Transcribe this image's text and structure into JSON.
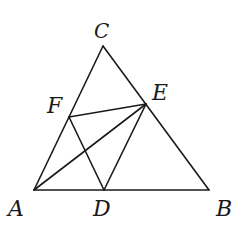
{
  "diagram": {
    "points": {
      "A": {
        "label": "A",
        "x": 34,
        "y": 190
      },
      "B": {
        "label": "B",
        "x": 209,
        "y": 190
      },
      "C": {
        "label": "C",
        "x": 103,
        "y": 46
      },
      "D": {
        "label": "D",
        "x": 104,
        "y": 190
      },
      "E": {
        "label": "E",
        "x": 146,
        "y": 104
      },
      "F": {
        "label": "F",
        "x": 69,
        "y": 117
      }
    },
    "segments": [
      "AB",
      "BC",
      "CA",
      "DE",
      "EF",
      "FD",
      "AE"
    ],
    "labels": {
      "A": "A",
      "B": "B",
      "C": "C",
      "D": "D",
      "E": "E",
      "F": "F"
    }
  }
}
